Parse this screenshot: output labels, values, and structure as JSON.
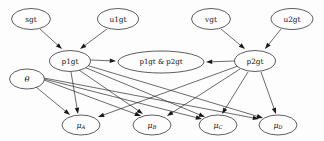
{
  "diagram": {
    "type": "directed-acyclic-graph",
    "background_color": "#fdfdfd",
    "node_fill": "#fdfdfd",
    "stroke_color": "#1a1a1a",
    "nodes": [
      {
        "id": "sgt",
        "label": "sgt",
        "cx": 31,
        "cy": 19,
        "rx": 19.5,
        "ry": 10.5,
        "row": "top"
      },
      {
        "id": "u1gt",
        "label": "u1gt",
        "cx": 118,
        "cy": 19,
        "rx": 20.5,
        "ry": 10.5,
        "row": "top"
      },
      {
        "id": "vgt",
        "label": "vgt",
        "cx": 211,
        "cy": 19,
        "rx": 19.5,
        "ry": 10.5,
        "row": "top"
      },
      {
        "id": "u2gt",
        "label": "u2gt",
        "cx": 292,
        "cy": 19,
        "rx": 21.0,
        "ry": 10.5,
        "row": "top"
      },
      {
        "id": "p1gt",
        "label": "p1gt",
        "cx": 70,
        "cy": 61,
        "rx": 20.5,
        "ry": 10.5,
        "row": "middle"
      },
      {
        "id": "p1gtp2gt",
        "label": "p1gt & p2gt",
        "cx": 161,
        "cy": 62,
        "rx": 43.0,
        "ry": 11.0,
        "row": "middle"
      },
      {
        "id": "p2gt",
        "label": "p2gt",
        "cx": 255,
        "cy": 61,
        "rx": 20.5,
        "ry": 10.5,
        "row": "middle"
      },
      {
        "id": "theta",
        "label": "θ",
        "cx": 27,
        "cy": 79,
        "rx": 17.5,
        "ry": 10.0,
        "row": "left"
      },
      {
        "id": "muA",
        "main": "μ",
        "sub": "A",
        "label": "μA",
        "cx": 81,
        "cy": 125,
        "rx": 19.0,
        "ry": 10.0,
        "row": "bottom"
      },
      {
        "id": "muB",
        "main": "μ",
        "sub": "B",
        "label": "μB",
        "cx": 152,
        "cy": 125,
        "rx": 19.0,
        "ry": 10.0,
        "row": "bottom"
      },
      {
        "id": "muC",
        "main": "μ",
        "sub": "C",
        "label": "μC",
        "cx": 218,
        "cy": 125,
        "rx": 19.0,
        "ry": 10.0,
        "row": "bottom"
      },
      {
        "id": "muD",
        "main": "μ",
        "sub": "D",
        "label": "μD",
        "cx": 278,
        "cy": 125,
        "rx": 19.0,
        "ry": 10.0,
        "row": "bottom"
      }
    ],
    "edges": [
      {
        "from": "sgt",
        "to": "p1gt",
        "x1": 40,
        "y1": 29,
        "x2": 62,
        "y2": 49
      },
      {
        "from": "u1gt",
        "to": "p1gt",
        "x1": 107,
        "y1": 29,
        "x2": 80,
        "y2": 49
      },
      {
        "from": "vgt",
        "to": "p2gt",
        "x1": 221,
        "y1": 29,
        "x2": 245,
        "y2": 49
      },
      {
        "from": "u2gt",
        "to": "p2gt",
        "x1": 281,
        "y1": 29,
        "x2": 265,
        "y2": 49
      },
      {
        "from": "p1gt",
        "to": "p1gtp2gt",
        "x1": 91,
        "y1": 60,
        "x2": 116,
        "y2": 61
      },
      {
        "from": "p2gt",
        "to": "p1gtp2gt",
        "x1": 234,
        "y1": 61,
        "x2": 206,
        "y2": 62
      },
      {
        "from": "p1gt",
        "to": "muA",
        "x1": 71,
        "y1": 72,
        "x2": 78,
        "y2": 114
      },
      {
        "from": "p1gt",
        "to": "muB",
        "x1": 79,
        "y1": 70,
        "x2": 143,
        "y2": 114
      },
      {
        "from": "p1gt",
        "to": "muC",
        "x1": 84,
        "y1": 67,
        "x2": 205,
        "y2": 117
      },
      {
        "from": "p1gt",
        "to": "muD",
        "x1": 86,
        "y1": 65,
        "x2": 263,
        "y2": 118
      },
      {
        "from": "p2gt",
        "to": "muA",
        "x1": 238,
        "y1": 66,
        "x2": 98,
        "y2": 117
      },
      {
        "from": "p2gt",
        "to": "muB",
        "x1": 240,
        "y1": 69,
        "x2": 167,
        "y2": 116
      },
      {
        "from": "p2gt",
        "to": "muC",
        "x1": 248,
        "y1": 72,
        "x2": 222,
        "y2": 114
      },
      {
        "from": "p2gt",
        "to": "muD",
        "x1": 261,
        "y1": 72,
        "x2": 276,
        "y2": 114
      },
      {
        "from": "theta",
        "to": "muA",
        "x1": 36,
        "y1": 87,
        "x2": 70,
        "y2": 115
      },
      {
        "from": "theta",
        "to": "muB",
        "x1": 44,
        "y1": 80,
        "x2": 141,
        "y2": 116
      },
      {
        "from": "theta",
        "to": "muC",
        "x1": 44,
        "y1": 79,
        "x2": 202,
        "y2": 119
      },
      {
        "from": "theta",
        "to": "muD",
        "x1": 44,
        "y1": 78,
        "x2": 259,
        "y2": 119
      }
    ]
  }
}
